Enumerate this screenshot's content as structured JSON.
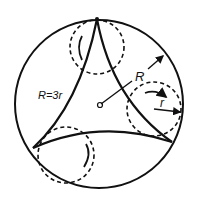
{
  "diagram": {
    "labels": {
      "ratio": "R=3r",
      "outer_radius": "R",
      "inner_radius": "r"
    },
    "colors": {
      "stroke": "#111111",
      "background": "#ffffff"
    },
    "elements": [
      "outer-circle",
      "deltoid-curve",
      "rolling-circle-top",
      "rolling-circle-right",
      "rolling-circle-bottom-left",
      "center-point",
      "radius-R-arrow",
      "radius-r-arrow",
      "rotation-arrows"
    ]
  }
}
